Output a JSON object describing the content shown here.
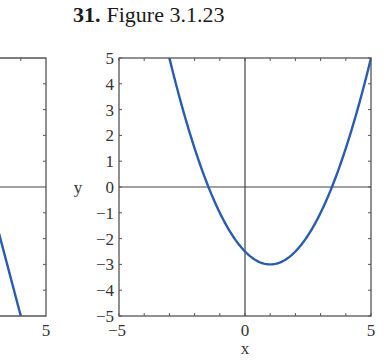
{
  "header": {
    "problem_number": "31.",
    "figure_label": "Figure 3.1.23"
  },
  "colors": {
    "curve": "#2a5cb0",
    "frame": "#555555",
    "axes": "#444444"
  },
  "chart_data": [
    {
      "type": "line",
      "title": "",
      "note": "Partially visible left panel (cropped at image edge)",
      "xlabel": "",
      "ylabel": "",
      "xlim": [
        3.17,
        5
      ],
      "ylim": [
        -5,
        5
      ],
      "x_tick_labels_visible": [
        "5"
      ],
      "series": [
        {
          "name": "curve",
          "x": [
            3.17,
            4.0
          ],
          "y": [
            -1.67,
            -5.0
          ]
        }
      ]
    },
    {
      "type": "line",
      "title": "Figure 3.1.23",
      "xlabel": "x",
      "ylabel": "y",
      "xlim": [
        -5,
        5
      ],
      "ylim": [
        -5,
        5
      ],
      "grid": false,
      "x_ticks": [
        -5,
        -4,
        -3,
        -2,
        -1,
        0,
        1,
        2,
        3,
        4,
        5
      ],
      "x_tick_labels": [
        "-5",
        "0",
        "5"
      ],
      "y_ticks": [
        -5,
        -4,
        -3,
        -2,
        -1,
        0,
        1,
        2,
        3,
        4,
        5
      ],
      "y_tick_labels": [
        "5",
        "4",
        "3",
        "2",
        "1",
        "0",
        "−1",
        "−2",
        "−3",
        "−4",
        "−5"
      ],
      "series": [
        {
          "name": "y = 0.5(x-1)^2 - 3",
          "x": [
            -3,
            -2,
            -1.45,
            -1,
            0,
            1,
            2,
            3,
            3.45,
            4,
            5
          ],
          "y": [
            5,
            1.5,
            0,
            -1,
            -2.5,
            -3,
            -2.5,
            -1,
            0,
            1.5,
            5
          ]
        }
      ],
      "annotations": {
        "vertex": [
          1,
          -3
        ],
        "y_intercept": -2.5,
        "x_intercepts": [
          -1.45,
          3.45
        ]
      }
    }
  ]
}
